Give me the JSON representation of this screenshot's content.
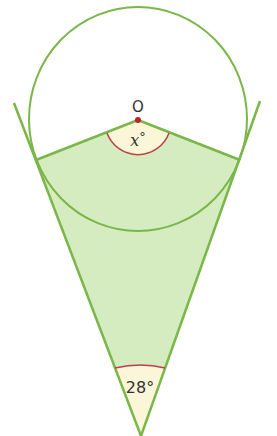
{
  "diagram": {
    "center_label": "O",
    "center_angle_variable": "x",
    "center_angle_suffix": "°",
    "apex_angle_label": "28°",
    "colors": {
      "line": "#7ab648",
      "fill": "#d4ecc0",
      "angle_fill": "#fbf6d8",
      "arc": "#c0404a",
      "center_dot": "#c8202a"
    }
  }
}
